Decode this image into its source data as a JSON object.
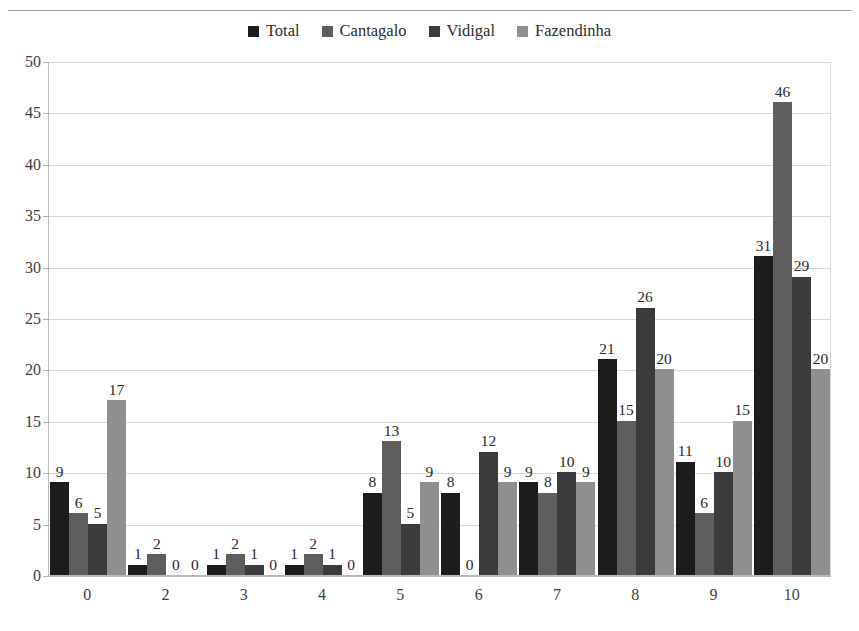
{
  "chart_data": {
    "type": "bar",
    "title": "",
    "subtitle": "",
    "xlabel": "",
    "ylabel": "",
    "ylim": [
      0,
      50
    ],
    "ytick_step": 5,
    "yticks": [
      50,
      45,
      40,
      35,
      30,
      25,
      20,
      15,
      10,
      5,
      0
    ],
    "grid": true,
    "grid_axis": "y",
    "legend_position": "top-center",
    "data_labels": true,
    "categories": [
      "0",
      "2",
      "3",
      "4",
      "5",
      "6",
      "7",
      "8",
      "9",
      "10"
    ],
    "series": [
      {
        "name": "Total",
        "color": "#1c1c1c",
        "values": [
          9,
          1,
          1,
          1,
          8,
          8,
          9,
          21,
          11,
          31
        ]
      },
      {
        "name": "Cantagalo",
        "color": "#5e5e5e",
        "values": [
          6,
          2,
          2,
          2,
          13,
          0,
          8,
          15,
          6,
          46
        ]
      },
      {
        "name": "Vidigal",
        "color": "#3b3b3b",
        "values": [
          5,
          0,
          1,
          1,
          5,
          12,
          10,
          26,
          10,
          29
        ]
      },
      {
        "name": "Fazendinha",
        "color": "#8f8f8f",
        "values": [
          17,
          0,
          0,
          0,
          9,
          9,
          9,
          20,
          15,
          20
        ]
      }
    ]
  },
  "legend": {
    "items": [
      {
        "label": "Total",
        "color": "#1c1c1c"
      },
      {
        "label": "Cantagalo",
        "color": "#5e5e5e"
      },
      {
        "label": "Vidigal",
        "color": "#3b3b3b"
      },
      {
        "label": "Fazendinha",
        "color": "#8f8f8f"
      }
    ]
  }
}
